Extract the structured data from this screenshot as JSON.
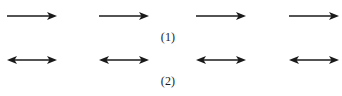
{
  "figure": {
    "background_color": "#ffffff",
    "stroke_color": "#1a1a1a",
    "width": 342,
    "height": 96
  },
  "rows": [
    {
      "id": "row-1",
      "label": "(1)",
      "arrow_type": "single-headed-right-arrow",
      "arrow_count": 4,
      "arrows": [
        {
          "name": "arrow-1-1",
          "direction": "right"
        },
        {
          "name": "arrow-1-2",
          "direction": "right"
        },
        {
          "name": "arrow-1-3",
          "direction": "right"
        },
        {
          "name": "arrow-1-4",
          "direction": "right"
        }
      ]
    },
    {
      "id": "row-2",
      "label": "(2)",
      "arrow_type": "double-headed-arrow",
      "arrow_count": 4,
      "arrows": [
        {
          "name": "arrow-2-1",
          "direction": "both"
        },
        {
          "name": "arrow-2-2",
          "direction": "both"
        },
        {
          "name": "arrow-2-3",
          "direction": "both"
        },
        {
          "name": "arrow-2-4",
          "direction": "both"
        }
      ]
    }
  ]
}
